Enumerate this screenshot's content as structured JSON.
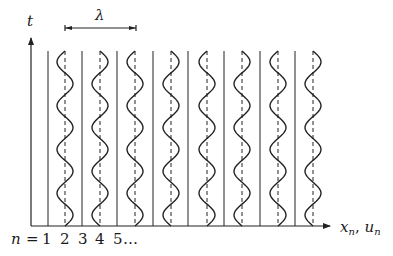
{
  "diagram": {
    "type": "wave-lattice",
    "labels": {
      "time_axis": "t",
      "wavelength": "λ",
      "space_axis_x": "x",
      "space_axis_sub": "n",
      "space_axis_sep": ", ",
      "space_axis_u": "u",
      "space_axis_u_sub": "n",
      "index_prefix": "n",
      "index_equals": "=",
      "indices": [
        "1",
        "2",
        "3",
        "4",
        "5"
      ],
      "index_ellipsis": "…"
    },
    "colors": {
      "line": "#222222",
      "background": "#ffffff"
    },
    "geometry": {
      "time_axis_x": 31,
      "time_axis_top": 37,
      "baseline_y": 226,
      "baseline_x_start": 31,
      "baseline_x_end": 331,
      "lines_top": 51,
      "solid_lines_x": [
        48,
        82,
        117,
        153,
        188,
        224,
        260,
        295
      ],
      "dashed_lines_x": [
        65,
        100,
        135,
        171,
        207,
        242,
        278,
        313
      ],
      "wave_amplitude": 8,
      "wave_periods": 4,
      "wavelength_bracket": {
        "x1": 65,
        "x2": 136,
        "y": 28
      }
    },
    "wave_phase_start": [
      "left",
      "right",
      "left",
      "right",
      "left",
      "right",
      "left",
      "right"
    ]
  }
}
